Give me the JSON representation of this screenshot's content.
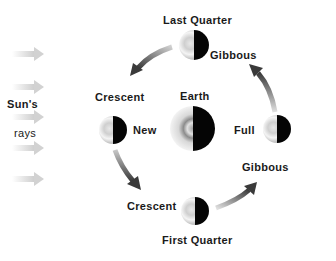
{
  "diagram": {
    "sun_rays": {
      "label_line1": "Sun's",
      "label_line2": "rays",
      "arrow_count": 5
    },
    "center": {
      "label": "Earth"
    },
    "phases": [
      {
        "id": "new",
        "label": "New"
      },
      {
        "id": "crescent-waxing",
        "label": "Crescent"
      },
      {
        "id": "first-quarter",
        "label": "First Quarter"
      },
      {
        "id": "gibbous-waxing",
        "label": "Gibbous"
      },
      {
        "id": "full",
        "label": "Full"
      },
      {
        "id": "gibbous-waning",
        "label": "Gibbous"
      },
      {
        "id": "last-quarter",
        "label": "Last Quarter"
      },
      {
        "id": "crescent-waning",
        "label": "Crescent"
      }
    ],
    "orbit_direction": "counterclockwise",
    "colors": {
      "arrow": "#5a5a5a",
      "ray_arrow": "#d8d8d8",
      "moon_dark_side": "#050505",
      "text": "#1a1a1a"
    }
  }
}
